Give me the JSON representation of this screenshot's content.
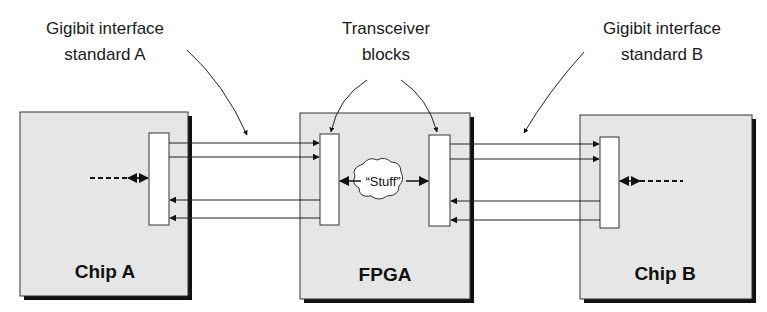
{
  "annotations": {
    "standard_a": [
      "Gigibit interface",
      "standard A"
    ],
    "transceivers": [
      "Transceiver",
      "blocks"
    ],
    "standard_b": [
      "Gigibit interface",
      "standard B"
    ]
  },
  "chips": {
    "chip_a": "Chip A",
    "fpga": "FPGA",
    "chip_b": "Chip B"
  },
  "stuff_label": "“Stuff”",
  "colors": {
    "chip_fill": "#e6e6e6",
    "shadow": "#111111",
    "line": "#222222",
    "block_fill": "#ffffff"
  }
}
